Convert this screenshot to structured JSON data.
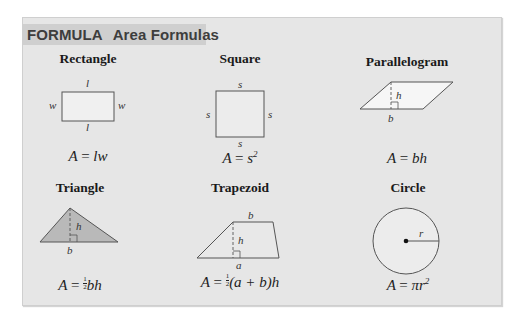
{
  "header": {
    "keyword": "FORMULA",
    "title": "Area Formulas"
  },
  "colors": {
    "panel_bg": "#e6e6e6",
    "header_bg": "#cfcfcf",
    "header_text": "#3d3d3d",
    "triangle_fill": "#b9b9b9",
    "shape_fill_light": "#f4f4f4",
    "stroke": "#555555"
  },
  "shapes": {
    "rectangle": {
      "name": "Rectangle",
      "labels": {
        "top": "l",
        "bottom": "l",
        "left": "w",
        "right": "w"
      },
      "formula_lhs": "A",
      "formula_eq": "=",
      "formula_rhs": "lw"
    },
    "square": {
      "name": "Square",
      "labels": {
        "top": "s",
        "bottom": "s",
        "left": "s",
        "right": "s"
      },
      "formula_lhs": "A",
      "formula_eq": "=",
      "formula_base": "s",
      "formula_exp": "2"
    },
    "parallelogram": {
      "name": "Parallelogram",
      "labels": {
        "height": "h",
        "base": "b"
      },
      "formula_lhs": "A",
      "formula_eq": "=",
      "formula_rhs": "bh"
    },
    "triangle": {
      "name": "Triangle",
      "labels": {
        "height": "h",
        "base": "b"
      },
      "formula_lhs": "A",
      "formula_eq": "=",
      "frac_num": "1",
      "frac_den": "2",
      "formula_rhs": "bh"
    },
    "trapezoid": {
      "name": "Trapezoid",
      "labels": {
        "top": "b",
        "height": "h",
        "bottom": "a"
      },
      "formula_lhs": "A",
      "formula_eq": "=",
      "frac_num": "1",
      "frac_den": "2",
      "formula_rhs": "(a + b)h"
    },
    "circle": {
      "name": "Circle",
      "labels": {
        "radius": "r"
      },
      "formula_lhs": "A",
      "formula_eq": "=",
      "formula_pi": "πr",
      "formula_exp": "2"
    }
  }
}
